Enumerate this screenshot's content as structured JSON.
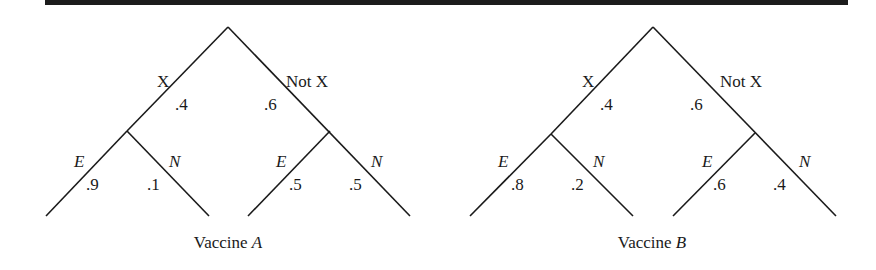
{
  "trees": [
    {
      "caption_prefix": "Vaccine ",
      "caption_var": "A",
      "branch_x_label": "X",
      "branch_notx_label": "Not X",
      "p_x": ".4",
      "p_notx": ".6",
      "x_e_label": "E",
      "x_n_label": "N",
      "x_e": ".9",
      "x_n": ".1",
      "notx_e_label": "E",
      "notx_n_label": "N",
      "notx_e": ".5",
      "notx_n": ".5"
    },
    {
      "caption_prefix": "Vaccine ",
      "caption_var": "B",
      "branch_x_label": "X",
      "branch_notx_label": "Not X",
      "p_x": ".4",
      "p_notx": ".6",
      "x_e_label": "E",
      "x_n_label": "N",
      "x_e": ".8",
      "x_n": ".2",
      "notx_e_label": "E",
      "notx_n_label": "N",
      "notx_e": ".6",
      "notx_n": ".4"
    }
  ],
  "colors": {
    "line": "#1a1a1a",
    "bar": "#1c1c1c"
  }
}
